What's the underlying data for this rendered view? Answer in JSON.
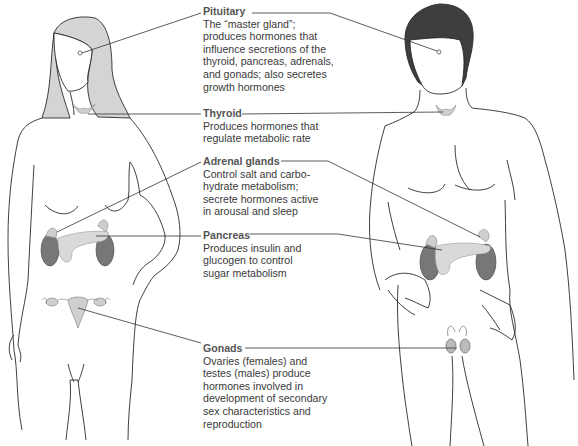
{
  "diagram": {
    "type": "labeled anatomical illustration",
    "figures": [
      {
        "name": "female",
        "position": "left",
        "glands_shown": [
          "pituitary",
          "thyroid",
          "adrenal glands",
          "pancreas",
          "ovaries"
        ]
      },
      {
        "name": "male",
        "position": "right",
        "glands_shown": [
          "pituitary",
          "thyroid",
          "adrenal glands",
          "pancreas",
          "testes"
        ]
      }
    ],
    "colors": {
      "female_hair": "#d4d4d4",
      "male_hair": "#3e3e3e",
      "kidney": "#777777",
      "gland_fill": "#cfcfcf",
      "outline": "#2a2a2a",
      "label_title": "#555555",
      "label_text": "#3a3a3a"
    }
  },
  "labels": [
    {
      "title": "Pituitary",
      "lines": [
        "The “master gland”;",
        "produces hormones that",
        "influence secretions of the",
        "thyroid, pancreas, adrenals,",
        "and gonads; also secretes",
        "growth hormones"
      ]
    },
    {
      "title": "Thyroid",
      "lines": [
        "Produces hormones that",
        "regulate metabolic rate"
      ]
    },
    {
      "title": "Adrenal glands",
      "lines": [
        "Control salt and carbo-",
        "hydrate metabolism;",
        "secrete hormones active",
        "in arousal and sleep"
      ]
    },
    {
      "title": "Pancreas",
      "lines": [
        "Produces insulin and",
        "glucogen to control",
        "sugar metabolism"
      ]
    },
    {
      "title": "Gonads",
      "lines": [
        "Ovaries (females) and",
        "testes (males) produce",
        "hormones involved in",
        "development of secondary",
        "sex characteristics and",
        "reproduction"
      ]
    }
  ]
}
